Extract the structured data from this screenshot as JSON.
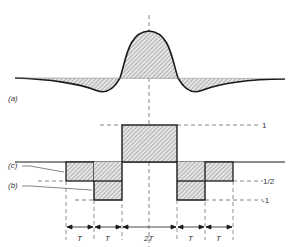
{
  "figure": {
    "labels": {
      "a": "(a)",
      "b": "(b)",
      "c": "(c)"
    },
    "levels": {
      "one": "1",
      "half": "1/2",
      "minus_one": "-1"
    },
    "intervals": [
      "T",
      "T",
      "2T",
      "T",
      "T"
    ],
    "colors": {
      "line": "#1a1a1a",
      "hatch": "#8a8a8a",
      "dashed": "#666666"
    }
  }
}
